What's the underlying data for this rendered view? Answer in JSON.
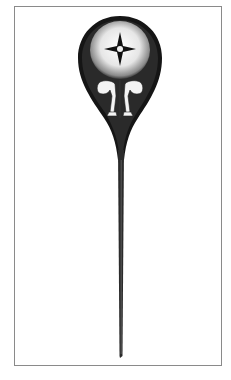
{
  "illustration": {
    "subject": "homunculus-in-sperm-cell",
    "style": "black-and-white engraving",
    "caption": ""
  },
  "colors": {
    "frame": "#8a8a8a",
    "ink": "#111111",
    "background": "#ffffff",
    "highlight": "#f2f2f2"
  }
}
